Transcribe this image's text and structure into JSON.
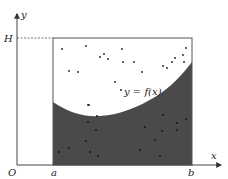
{
  "diagram": {
    "labels": {
      "y_axis": "y",
      "x_axis": "x",
      "origin": "O",
      "a": "a",
      "b": "b",
      "height": "H",
      "curve": "y = f(x)"
    },
    "colors": {
      "background": "#ffffff",
      "shaded_region": "#4a4a4a",
      "lines": "#555555",
      "points": "#1a1a1a",
      "text": "#222222"
    },
    "points_above_curve": [
      [
        62,
        49
      ],
      [
        86,
        46
      ],
      [
        100,
        57
      ],
      [
        104,
        54
      ],
      [
        108,
        59
      ],
      [
        122,
        49
      ],
      [
        123,
        62
      ],
      [
        69,
        71
      ],
      [
        78,
        72
      ],
      [
        115,
        82
      ],
      [
        121,
        90
      ],
      [
        134,
        62
      ],
      [
        142,
        72
      ],
      [
        163,
        66
      ],
      [
        167,
        68
      ],
      [
        175,
        58
      ],
      [
        172,
        62
      ],
      [
        186,
        48
      ],
      [
        183,
        55
      ],
      [
        184,
        62
      ],
      [
        88,
        105
      ]
    ],
    "points_below_curve": [
      [
        89,
        105
      ],
      [
        97,
        116
      ],
      [
        88,
        122
      ],
      [
        96,
        130
      ],
      [
        86,
        141
      ],
      [
        90,
        152
      ],
      [
        98,
        156
      ],
      [
        59,
        152
      ],
      [
        69,
        148
      ],
      [
        163,
        115
      ],
      [
        186,
        119
      ],
      [
        162,
        131
      ],
      [
        177,
        123
      ],
      [
        155,
        140
      ],
      [
        140,
        150
      ],
      [
        160,
        156
      ],
      [
        177,
        130
      ],
      [
        145,
        127
      ]
    ]
  }
}
